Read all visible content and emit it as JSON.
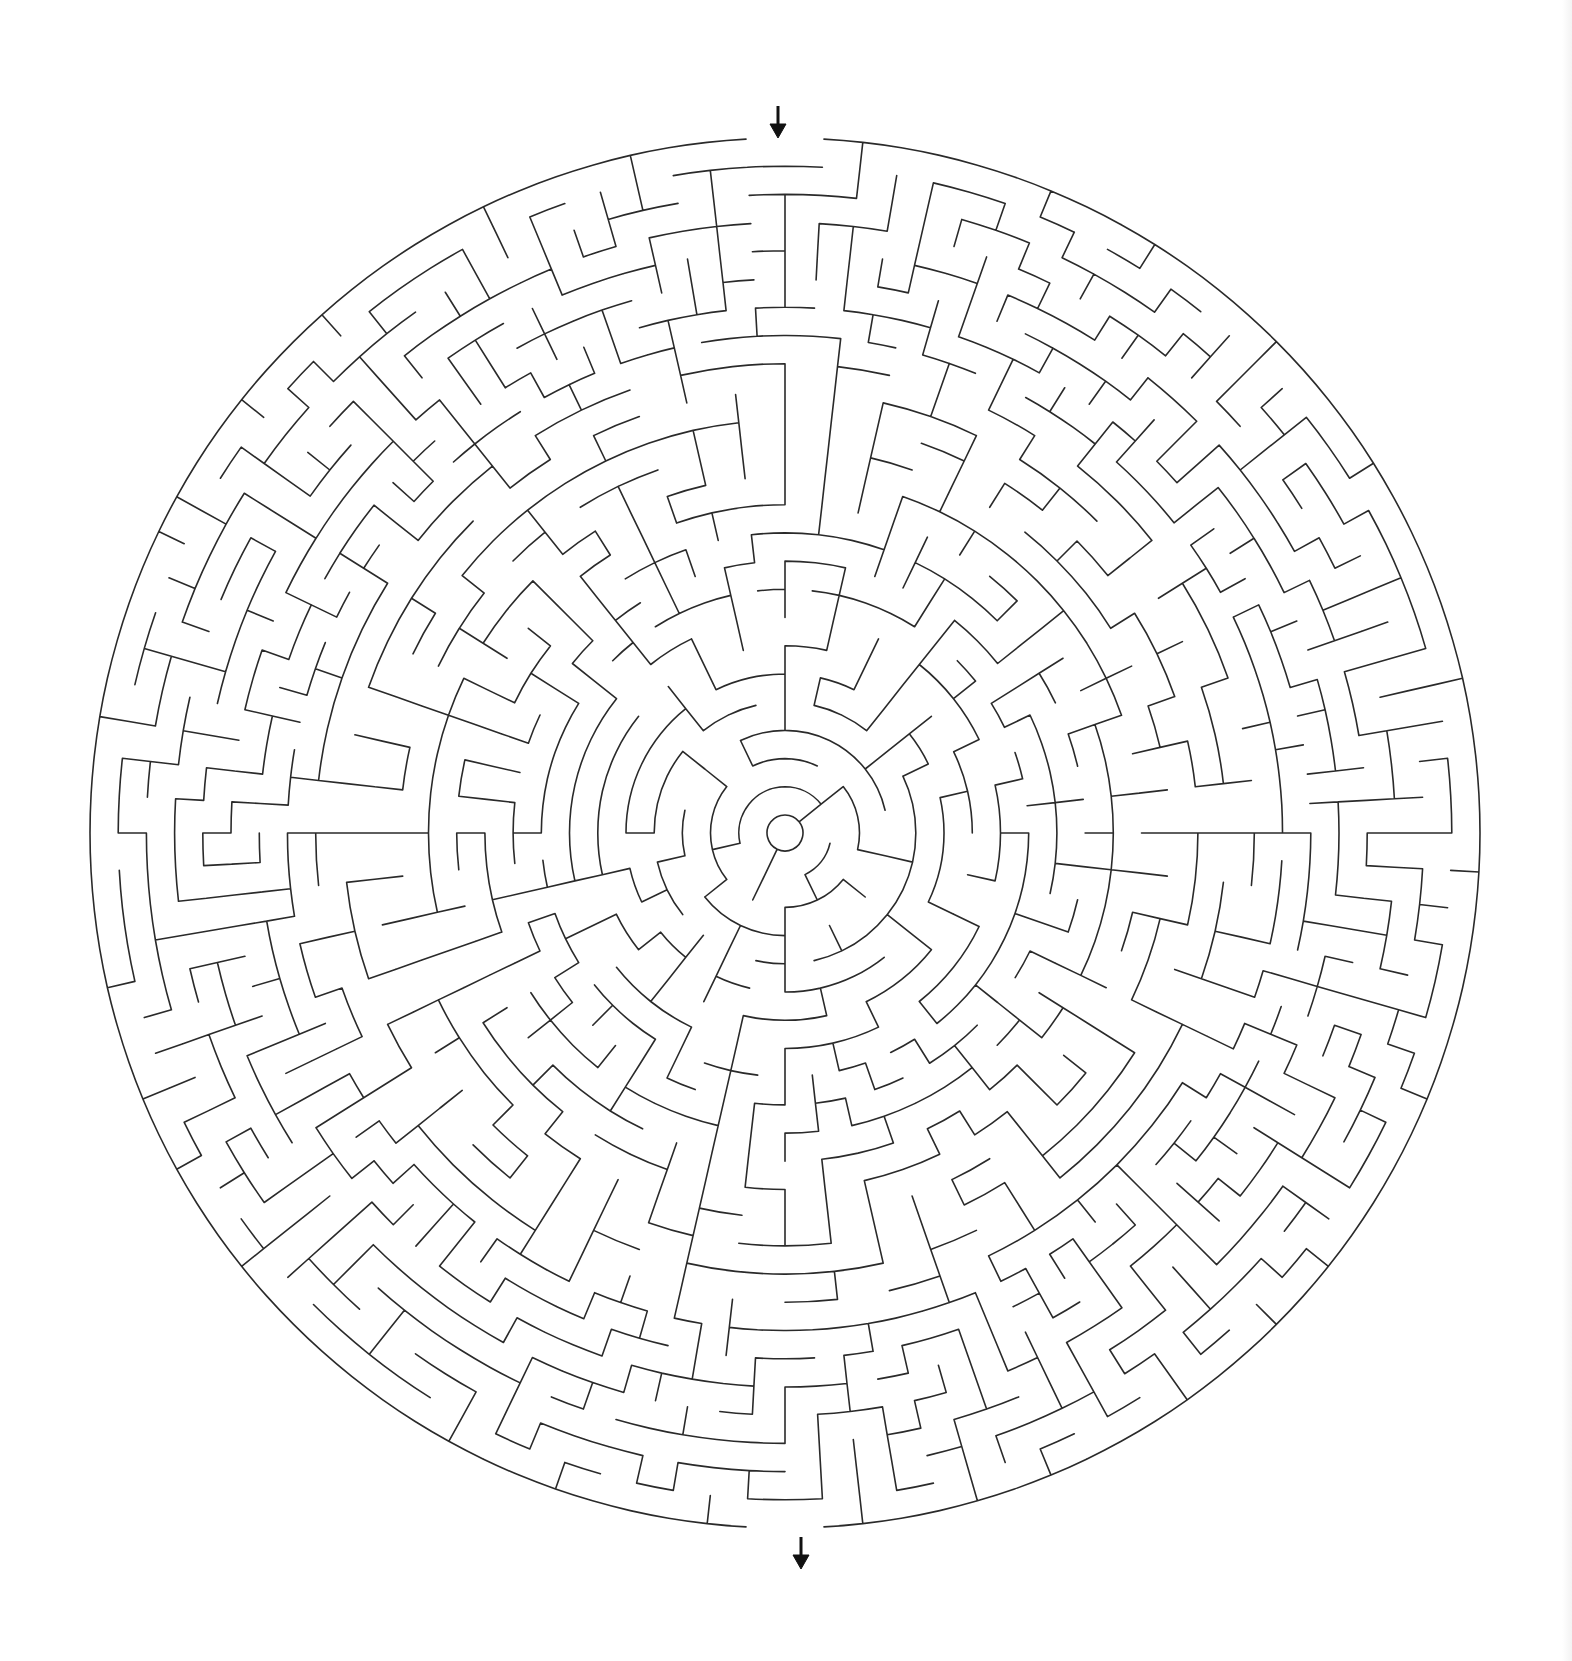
{
  "puzzle": {
    "type": "circular-maze",
    "center": [
      785,
      833
    ],
    "outer_radius": 695,
    "inner_radius": 18,
    "rings": 24,
    "wall_color": "#2a2a2a",
    "background": "#ffffff",
    "entrance": {
      "label": "start",
      "angle_deg": -90,
      "arrow_x": 778,
      "arrow_top": 106,
      "arrow_bottom": 138,
      "direction": "down"
    },
    "exit": {
      "label": "finish",
      "angle_deg": 90,
      "arrow_x": 801,
      "arrow_top": 1537,
      "arrow_bottom": 1569,
      "direction": "down"
    },
    "seed": 20240
  }
}
